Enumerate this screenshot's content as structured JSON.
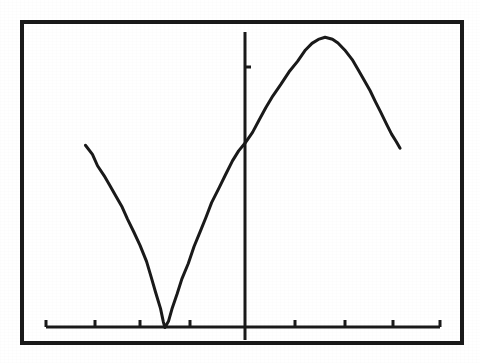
{
  "figure": {
    "title": "",
    "background_color": "#ffffff",
    "ink_color": "#1a1a1a",
    "frame": {
      "label": "plot-border",
      "x": 22,
      "y": 22,
      "width": 440,
      "height": 321,
      "stroke_width": 4
    }
  },
  "chart_data": {
    "type": "line",
    "title": "",
    "subtitle": "",
    "xlabel": "",
    "ylabel": "",
    "grid": false,
    "legend": null,
    "legend_position": "none",
    "axes": {
      "x_axis": {
        "name": "x-axis",
        "pixel_y": 327,
        "pixel_x_start": 46,
        "pixel_x_end": 440,
        "tick_direction": "up",
        "tick_length": 7,
        "tick_pixels": [
          46,
          95,
          140,
          190,
          295,
          345,
          393,
          440
        ],
        "tick_labels": [
          "",
          "",
          "",
          "",
          "",
          "",
          "",
          ""
        ],
        "xlim": [
          -2.2,
          4.0
        ]
      },
      "y_axis": {
        "name": "y-axis",
        "pixel_x": 245,
        "pixel_y_start": 32,
        "pixel_y_end": 340,
        "tick_direction": "right",
        "tick_length": 6,
        "tick_pixels_y": [
          67
        ],
        "tick_labels": [
          ""
        ],
        "ylim": [
          -0.15,
          2.3
        ]
      }
    },
    "series": [
      {
        "name": "curve",
        "stroke": "#1a1a1a",
        "stroke_width": 3,
        "description": "smooth sinusoidal arc: falls from upper-left to a minimum touching the x-axis, rises crossing the vertical axis, peaks, then falls again",
        "points_pixels": [
          [
            86,
            146
          ],
          [
            92,
            155
          ],
          [
            98,
            165
          ],
          [
            104,
            175
          ],
          [
            110,
            185
          ],
          [
            116,
            196
          ],
          [
            122,
            207
          ],
          [
            128,
            219
          ],
          [
            134,
            232
          ],
          [
            140,
            246
          ],
          [
            146,
            261
          ],
          [
            151,
            277
          ],
          [
            156,
            293
          ],
          [
            160,
            308
          ],
          [
            163,
            322
          ],
          [
            165,
            327
          ],
          [
            168,
            322
          ],
          [
            172,
            309
          ],
          [
            177,
            294
          ],
          [
            182,
            279
          ],
          [
            188,
            263
          ],
          [
            194,
            247
          ],
          [
            200,
            232
          ],
          [
            206,
            217
          ],
          [
            212,
            203
          ],
          [
            219,
            188
          ],
          [
            226,
            174
          ],
          [
            233,
            161
          ],
          [
            239,
            151
          ],
          [
            245,
            143
          ],
          [
            252,
            132
          ],
          [
            259,
            120
          ],
          [
            266,
            108
          ],
          [
            273,
            96
          ],
          [
            281,
            84
          ],
          [
            289,
            72
          ],
          [
            297,
            61
          ],
          [
            305,
            50
          ],
          [
            312,
            43
          ],
          [
            318,
            39
          ],
          [
            325,
            38
          ],
          [
            332,
            39
          ],
          [
            338,
            43
          ],
          [
            345,
            50
          ],
          [
            352,
            60
          ],
          [
            358,
            70
          ],
          [
            364,
            80
          ],
          [
            370,
            91
          ],
          [
            376,
            102
          ],
          [
            381,
            112
          ],
          [
            387,
            124
          ],
          [
            392,
            134
          ],
          [
            396,
            142
          ],
          [
            400,
            148
          ]
        ],
        "x_values": [
          -1.96,
          -1.85,
          -1.75,
          -1.65,
          -1.55,
          -1.46,
          -1.36,
          -1.26,
          -1.16,
          -1.06,
          -0.96,
          -0.88,
          -0.8,
          -0.74,
          -0.69,
          -0.65,
          -0.6,
          -0.54,
          -0.46,
          -0.38,
          -0.29,
          -0.2,
          -0.1,
          0.0,
          0.1,
          0.21,
          0.32,
          0.43,
          0.52,
          0.6,
          0.71,
          0.82,
          0.93,
          1.04,
          1.17,
          1.29,
          1.42,
          1.55,
          1.65,
          1.75,
          1.86,
          1.97,
          2.07,
          2.18,
          2.29,
          2.38,
          2.48,
          2.57,
          2.66,
          2.74,
          2.84,
          2.92,
          2.98,
          3.05
        ],
        "y_values": [
          1.38,
          1.31,
          1.23,
          1.16,
          1.09,
          1.01,
          0.93,
          0.84,
          0.74,
          0.64,
          0.53,
          0.42,
          0.3,
          0.19,
          0.09,
          0.05,
          0.09,
          0.19,
          0.3,
          0.42,
          0.53,
          0.64,
          0.74,
          0.85,
          0.95,
          1.06,
          1.17,
          1.27,
          1.34,
          1.4,
          1.49,
          1.57,
          1.66,
          1.75,
          1.83,
          1.92,
          2.0,
          2.08,
          2.13,
          2.16,
          2.17,
          2.16,
          2.13,
          2.08,
          2.01,
          1.93,
          1.86,
          1.78,
          1.7,
          1.62,
          1.53,
          1.46,
          1.4,
          1.35
        ]
      }
    ],
    "annotations": []
  }
}
